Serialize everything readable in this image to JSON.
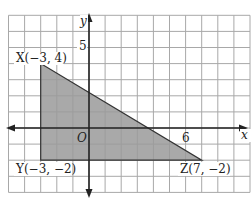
{
  "chart_data": {
    "type": "coordinate-plane",
    "title": "",
    "xlabel": "x",
    "ylabel": "y",
    "xlim": [
      -5,
      10
    ],
    "ylim": [
      -4,
      7
    ],
    "grid": true,
    "tick_labels": {
      "x": [
        "6"
      ],
      "y": [
        "5"
      ]
    },
    "origin_label": "O",
    "polygon": {
      "name": "triangle XYZ",
      "fill": "#9a9a9a",
      "vertices": [
        {
          "name": "X",
          "x": -3,
          "y": 4,
          "label": "X(−3, 4)"
        },
        {
          "name": "Y",
          "x": -3,
          "y": -2,
          "label": "Y(−3, −2)"
        },
        {
          "name": "Z",
          "x": 7,
          "y": -2,
          "label": "Z(7, −2)"
        }
      ]
    }
  },
  "labels": {
    "x_axis": "x",
    "y_axis": "y",
    "origin": "O",
    "tick_x6": "6",
    "tick_y5": "5",
    "vertex_x": "X(−3, 4)",
    "vertex_y": "Y(−3, −2)",
    "vertex_z": "Z(7, −2)"
  },
  "colors": {
    "grid": "#9a9a9a",
    "axis": "#222222",
    "shade": "#9a9a9a",
    "edge": "#333333"
  }
}
